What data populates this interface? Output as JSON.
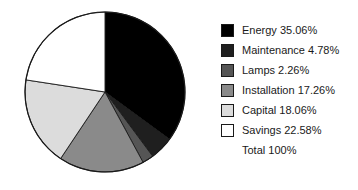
{
  "chart_data": {
    "type": "pie",
    "title": "",
    "subtitle": "",
    "xlabel": "",
    "ylabel": "",
    "grid": false,
    "legend_position": "right",
    "start_angle_deg": 0,
    "direction": "clockwise",
    "units": "percent",
    "categories": [
      "Energy",
      "Maintenance",
      "Lamps",
      "Installation",
      "Capital",
      "Savings"
    ],
    "values": [
      35.06,
      4.78,
      2.26,
      17.26,
      18.06,
      22.58
    ],
    "colors": [
      "#000000",
      "#1f1f1f",
      "#555555",
      "#8a8a8a",
      "#dcdcdc",
      "#ffffff"
    ],
    "total_label": "Total 100%",
    "total_value": 100,
    "slices": [
      {
        "label": "Energy",
        "value": 35.06,
        "text": "Energy 35.06%",
        "color": "#000000"
      },
      {
        "label": "Maintenance",
        "value": 4.78,
        "text": "Maintenance 4.78%",
        "color": "#1f1f1f"
      },
      {
        "label": "Lamps",
        "value": 2.26,
        "text": "Lamps 2.26%",
        "color": "#555555"
      },
      {
        "label": "Installation",
        "value": 17.26,
        "text": "Installation 17.26%",
        "color": "#8a8a8a"
      },
      {
        "label": "Capital",
        "value": 18.06,
        "text": "Capital 18.06%",
        "color": "#dcdcdc"
      },
      {
        "label": "Savings",
        "value": 22.58,
        "text": "Savings 22.58%",
        "color": "#ffffff"
      }
    ]
  },
  "legend": {
    "items": [
      {
        "text": "Energy 35.06%"
      },
      {
        "text": "Maintenance 4.78%"
      },
      {
        "text": "Lamps 2.26%"
      },
      {
        "text": "Installation 17.26%"
      },
      {
        "text": "Capital 18.06%"
      },
      {
        "text": "Savings 22.58%"
      }
    ],
    "total": {
      "text": "Total 100%"
    }
  },
  "style": {
    "outline_color": "#1a1a1a",
    "text_color": "#1a1a1a",
    "background": "#ffffff"
  }
}
